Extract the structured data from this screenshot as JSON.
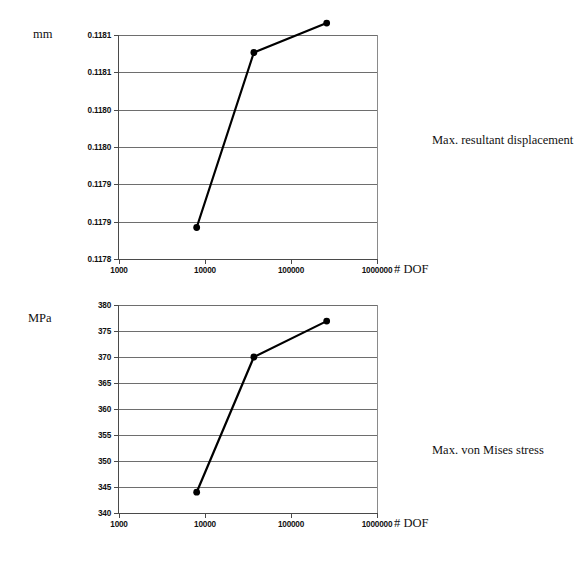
{
  "page": {
    "background": "#ffffff",
    "ink": "#111111",
    "gridline_color": "#6e6e6e",
    "series_color": "#000000"
  },
  "charts": [
    {
      "id": "displacement",
      "unit_label": "mm",
      "xaxis_title": "# DOF",
      "side_caption": "Max. resultant displacement",
      "x_ticklabels": [
        "1000",
        "10000",
        "100000",
        "1000000"
      ],
      "y_ticklabels": [
        "0.1181",
        "0.1181",
        "0.1180",
        "0.1180",
        "0.1179",
        "0.1179",
        "0.1178"
      ]
    },
    {
      "id": "stress",
      "unit_label": "MPa",
      "xaxis_title": "# DOF",
      "side_caption": "Max. von Mises stress",
      "x_ticklabels": [
        "1000",
        "10000",
        "100000",
        "1000000"
      ],
      "y_ticklabels": [
        "380",
        "375",
        "370",
        "365",
        "360",
        "355",
        "350",
        "345",
        "340"
      ]
    }
  ],
  "chart_data": [
    {
      "type": "line",
      "title": "Max. resultant displacement",
      "xlabel": "# DOF",
      "ylabel": "mm",
      "xscale": "log",
      "xlim": [
        1000,
        1000000
      ],
      "ylim": [
        0.1178,
        0.11812
      ],
      "xticks": [
        1000,
        10000,
        100000,
        1000000
      ],
      "xticklabels": [
        "1000",
        "10000",
        "100000",
        "1000000"
      ],
      "yticks": [
        0.11812,
        0.118067,
        0.118013,
        0.11796,
        0.117907,
        0.117853,
        0.1178
      ],
      "yticklabels": [
        "0.1181",
        "0.1181",
        "0.1180",
        "0.1180",
        "0.1179",
        "0.1179",
        "0.1178"
      ],
      "grid": "horizontal",
      "legend": "none",
      "series": [
        {
          "name": "Max. resultant displacement",
          "marker": "filled-circle",
          "x": [
            8000,
            37000,
            260000
          ],
          "y": [
            0.117845,
            0.118095,
            0.118137
          ]
        }
      ]
    },
    {
      "type": "line",
      "title": "Max. von Mises stress",
      "xlabel": "# DOF",
      "ylabel": "MPa",
      "xscale": "log",
      "xlim": [
        1000,
        1000000
      ],
      "ylim": [
        340,
        380
      ],
      "xticks": [
        1000,
        10000,
        100000,
        1000000
      ],
      "xticklabels": [
        "1000",
        "10000",
        "100000",
        "1000000"
      ],
      "yticks": [
        380,
        375,
        370,
        365,
        360,
        355,
        350,
        345,
        340
      ],
      "yticklabels": [
        "380",
        "375",
        "370",
        "365",
        "360",
        "355",
        "350",
        "345",
        "340"
      ],
      "grid": "horizontal",
      "legend": "none",
      "series": [
        {
          "name": "Max. von Mises stress",
          "marker": "filled-circle",
          "x": [
            8000,
            37000,
            260000
          ],
          "y": [
            344.0,
            370.0,
            376.9
          ]
        }
      ]
    }
  ]
}
